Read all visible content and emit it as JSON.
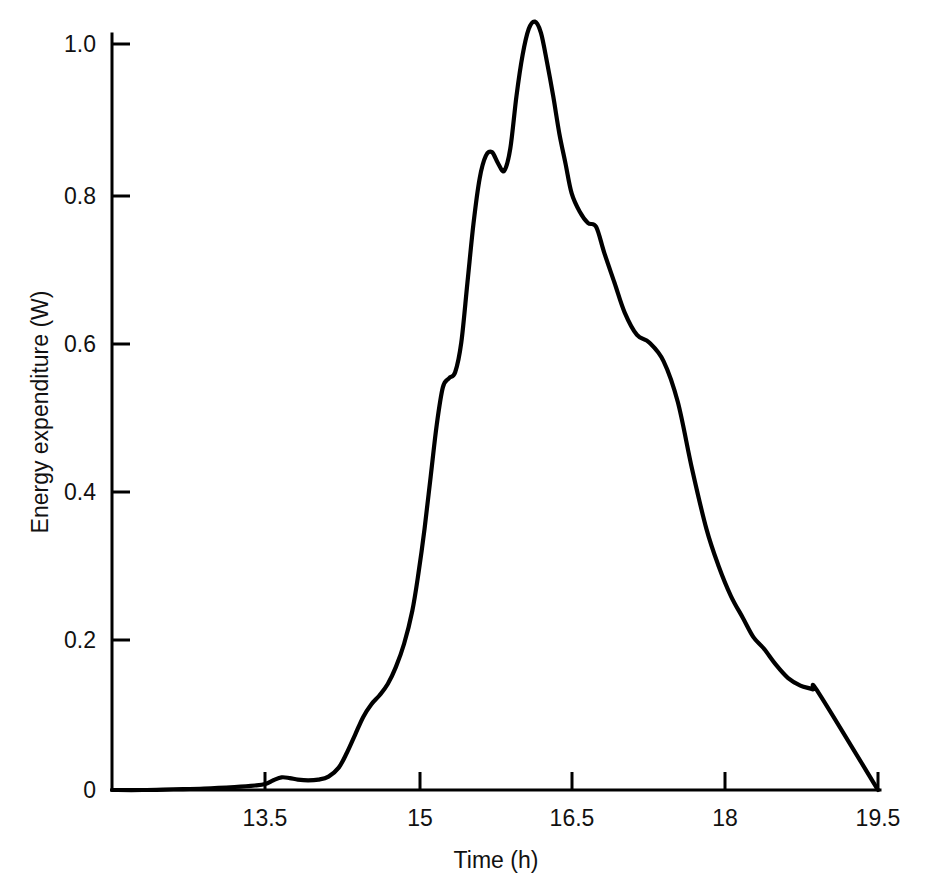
{
  "figure": {
    "title": "",
    "caption": "FIG. 2.4. Energy expenditure (W)",
    "background_color": "#ffffff",
    "line_color": "#000000",
    "text_color": "#111111"
  },
  "axes": {
    "x": {
      "label": "Time (h)",
      "ticks": [
        "13.5",
        "15",
        "16.5",
        "18",
        "19.5"
      ],
      "tick_values": [
        13.5,
        15,
        16.5,
        18,
        19.5
      ],
      "min": 12.0,
      "max": 19.5
    },
    "y": {
      "label": "Energy expenditure (W)",
      "ticks": [
        "0",
        "0.2",
        "0.4",
        "0.6",
        "0.8",
        "1.0"
      ],
      "tick_values": [
        0,
        0.2,
        0.4,
        0.6,
        0.8,
        1.0
      ],
      "min": 0,
      "max": 1.0
    }
  },
  "chart_data": {
    "type": "line",
    "title": "",
    "xlabel": "Time (h)",
    "ylabel": "Energy expenditure (W)",
    "xlim": [
      12.0,
      19.5
    ],
    "ylim": [
      0,
      1.04
    ],
    "grid": false,
    "legend": null,
    "series": [
      {
        "name": "Energy expenditure",
        "color": "#000000",
        "x": [
          12.0,
          12.3,
          12.6,
          12.9,
          13.2,
          13.4,
          13.5,
          13.58,
          13.66,
          13.74,
          13.82,
          13.92,
          14.02,
          14.12,
          14.22,
          14.3,
          14.38,
          14.46,
          14.54,
          14.62,
          14.7,
          14.78,
          14.86,
          14.94,
          15.0,
          15.06,
          15.12,
          15.18,
          15.24,
          15.3,
          15.36,
          15.42,
          15.48,
          15.54,
          15.6,
          15.66,
          15.72,
          15.78,
          15.84,
          15.9,
          15.96,
          16.02,
          16.08,
          16.14,
          16.2,
          16.26,
          16.32,
          16.38,
          16.44,
          16.5,
          16.58,
          16.66,
          16.74,
          16.82,
          16.92,
          17.02,
          17.14,
          17.26,
          17.4,
          17.54,
          17.68,
          17.82,
          17.94,
          18.06,
          18.18,
          18.28,
          18.38,
          18.5,
          18.62,
          18.74,
          18.86,
          18.92,
          19.5
        ],
        "y": [
          0.0,
          0.0,
          0.001,
          0.002,
          0.004,
          0.006,
          0.008,
          0.013,
          0.017,
          0.016,
          0.014,
          0.013,
          0.014,
          0.018,
          0.03,
          0.05,
          0.074,
          0.098,
          0.115,
          0.127,
          0.142,
          0.165,
          0.196,
          0.24,
          0.29,
          0.35,
          0.42,
          0.49,
          0.54,
          0.552,
          0.56,
          0.6,
          0.68,
          0.76,
          0.82,
          0.85,
          0.855,
          0.84,
          0.83,
          0.86,
          0.93,
          0.985,
          1.02,
          1.03,
          1.015,
          0.975,
          0.93,
          0.88,
          0.84,
          0.8,
          0.775,
          0.76,
          0.755,
          0.72,
          0.68,
          0.64,
          0.61,
          0.6,
          0.575,
          0.52,
          0.43,
          0.35,
          0.3,
          0.26,
          0.23,
          0.205,
          0.19,
          0.168,
          0.15,
          0.14,
          0.135,
          0.13,
          0.0
        ]
      }
    ]
  }
}
